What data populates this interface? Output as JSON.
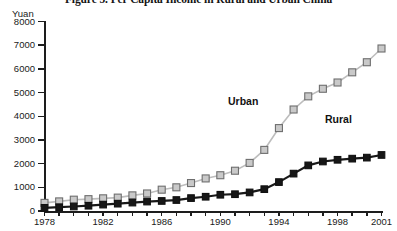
{
  "title": "Figure 5. Per Capita Income in Rural and Urban China",
  "y_axis_unit": "Yuan",
  "series_labels": {
    "urban": "Urban",
    "rural": "Rural"
  },
  "colors": {
    "urban_fill": "#c9c9c9",
    "urban_edge": "#6e6e6e",
    "urban_line": "#bdbdbd",
    "rural_fill": "#171717",
    "rural_edge": "#111111",
    "rural_line": "#191919",
    "axis": "#1d1d1d",
    "text": "#1a1a1a",
    "background": "#ffffff"
  },
  "chart_data": {
    "type": "line",
    "title": "Figure 5. Per Capita Income in Rural and Urban China",
    "xlabel": "",
    "ylabel": "Yuan",
    "ylim": [
      0,
      8000
    ],
    "xlim": [
      1978,
      2001
    ],
    "yticks": [
      0,
      1000,
      2000,
      3000,
      4000,
      5000,
      6000,
      7000,
      8000
    ],
    "ytick_labels": [
      "0",
      "1000",
      "2000",
      "3000",
      "4000",
      "5000",
      "6000",
      "7000",
      "8000"
    ],
    "xticks": [
      1978,
      1979,
      1980,
      1981,
      1982,
      1983,
      1984,
      1985,
      1986,
      1987,
      1988,
      1989,
      1990,
      1991,
      1992,
      1993,
      1994,
      1995,
      1996,
      1997,
      1998,
      1999,
      2000,
      2001
    ],
    "xtick_labels_shown": [
      "1978",
      "1982",
      "1986",
      "1990",
      "1994",
      "1998",
      "2001"
    ],
    "grid": false,
    "legend": "inline-annotations",
    "x": [
      1978,
      1979,
      1980,
      1981,
      1982,
      1983,
      1984,
      1985,
      1986,
      1987,
      1988,
      1989,
      1990,
      1991,
      1992,
      1993,
      1994,
      1995,
      1996,
      1997,
      1998,
      1999,
      2000,
      2001
    ],
    "series": [
      {
        "name": "Urban",
        "marker": "open-square",
        "values": [
          343,
          405,
          478,
          500,
          535,
          565,
          660,
          740,
          900,
          1000,
          1180,
          1375,
          1510,
          1700,
          2030,
          2580,
          3500,
          4285,
          4840,
          5160,
          5425,
          5855,
          6280,
          6860
        ]
      },
      {
        "name": "Rural",
        "marker": "filled-square",
        "values": [
          134,
          160,
          191,
          223,
          270,
          310,
          355,
          398,
          424,
          463,
          545,
          602,
          686,
          709,
          784,
          922,
          1221,
          1578,
          1926,
          2090,
          2162,
          2210,
          2253,
          2366
        ]
      }
    ]
  }
}
